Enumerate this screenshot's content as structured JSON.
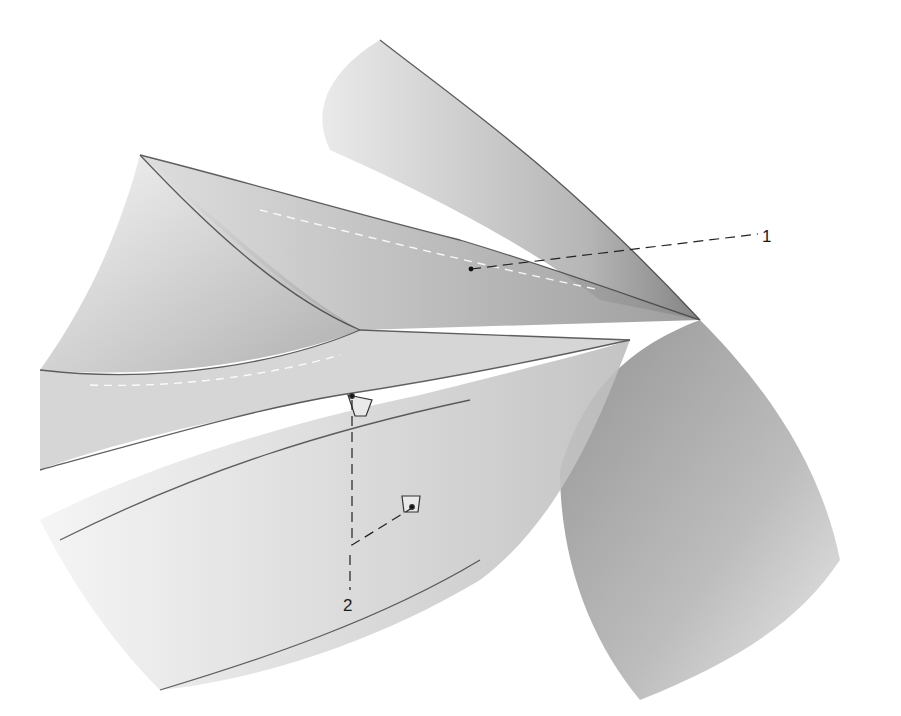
{
  "figure": {
    "type": "surgical-illustration",
    "colors": {
      "background": "#ffffff",
      "shade_dark": "#5a5a5a",
      "shade_mid": "#9a9a9a",
      "shade_light": "#d6d6d6",
      "line": "#222222"
    }
  },
  "labels": [
    {
      "id": "1",
      "text": "1",
      "x": 762,
      "y": 228,
      "anchor": {
        "x": 471,
        "y": 269
      }
    },
    {
      "id": "2",
      "text": "2",
      "x": 343,
      "y": 597,
      "anchor": {
        "x": 352,
        "y": 396
      },
      "anchor2": {
        "x": 412,
        "y": 508
      }
    }
  ]
}
